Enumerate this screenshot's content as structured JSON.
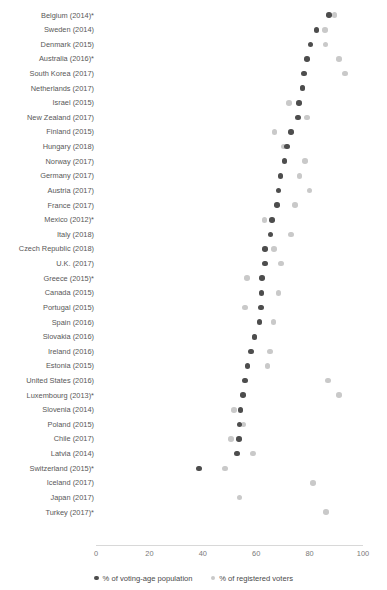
{
  "chart_data": {
    "type": "scatter",
    "subtype": "dot-plot",
    "title": "",
    "xlabel": "",
    "ylabel": "",
    "xlim": [
      0,
      100
    ],
    "xticks": [
      0,
      20,
      40,
      60,
      80,
      100
    ],
    "grid": false,
    "legend_position": "bottom",
    "series": [
      {
        "name": "% of voting-age population",
        "color": "#4d4d4d"
      },
      {
        "name": "% of registered voters",
        "color": "#c9c9c9"
      }
    ],
    "categories": [
      "Belgium (2014)*",
      "Sweden (2014)",
      "Denmark (2015)",
      "Australia (2016)*",
      "South Korea (2017)",
      "Netherlands (2017)",
      "Israel (2015)",
      "New Zealand (2017)",
      "Finland (2015)",
      "Hungary (2018)",
      "Norway (2017)",
      "Germany (2017)",
      "Austria (2017)",
      "France (2017)",
      "Mexico (2012)*",
      "Italy (2018)",
      "Czech Republic (2018)",
      "U.K. (2017)",
      "Greece (2015)*",
      "Canada (2015)",
      "Portugal (2015)",
      "Spain (2016)",
      "Slovakia (2016)",
      "Ireland (2016)",
      "Estonia (2015)",
      "United States (2016)",
      "Luxembourg (2013)*",
      "Slovenia (2014)",
      "Poland (2015)",
      "Chile (2017)",
      "Latvia (2014)",
      "Switzerland (2015)*",
      "Iceland (2017)",
      "Japan (2017)",
      "Turkey (2017)*"
    ],
    "rows": [
      {
        "label": "Belgium (2014)*",
        "voting_age": 87.2,
        "registered": 89.4
      },
      {
        "label": "Sweden (2014)",
        "voting_age": 82.6,
        "registered": 85.8
      },
      {
        "label": "Denmark (2015)",
        "voting_age": 80.3,
        "registered": 85.9
      },
      {
        "label": "Australia (2016)*",
        "voting_age": 79.0,
        "registered": 91.0
      },
      {
        "label": "South Korea (2017)",
        "voting_age": 77.9,
        "registered": 93.2
      },
      {
        "label": "Netherlands (2017)",
        "voting_age": 77.3,
        "registered": 77.3
      },
      {
        "label": "Israel (2015)",
        "voting_age": 76.1,
        "registered": 72.3
      },
      {
        "label": "New Zealand (2017)",
        "voting_age": 75.7,
        "registered": 79.0
      },
      {
        "label": "Finland (2015)",
        "voting_age": 73.1,
        "registered": 66.9
      },
      {
        "label": "Hungary (2018)",
        "voting_age": 71.6,
        "registered": 70.2
      },
      {
        "label": "Norway (2017)",
        "voting_age": 70.6,
        "registered": 78.2
      },
      {
        "label": "Germany (2017)",
        "voting_age": 69.1,
        "registered": 76.2
      },
      {
        "label": "Austria (2017)",
        "voting_age": 68.3,
        "registered": 80.0
      },
      {
        "label": "France (2017)",
        "voting_age": 67.9,
        "registered": 74.6
      },
      {
        "label": "Mexico (2012)*",
        "voting_age": 66.0,
        "registered": 63.1
      },
      {
        "label": "Italy (2018)",
        "voting_age": 65.4,
        "registered": 73.1
      },
      {
        "label": "Czech Republic (2018)",
        "voting_age": 63.4,
        "registered": 66.7
      },
      {
        "label": "U.K. (2017)",
        "voting_age": 63.2,
        "registered": 69.3
      },
      {
        "label": "Greece (2015)*",
        "voting_age": 62.1,
        "registered": 56.6
      },
      {
        "label": "Canada (2015)",
        "voting_age": 62.0,
        "registered": 68.3
      },
      {
        "label": "Portugal (2015)",
        "voting_age": 61.8,
        "registered": 55.8
      },
      {
        "label": "Spain (2016)",
        "voting_age": 61.2,
        "registered": 66.5
      },
      {
        "label": "Slovakia (2016)",
        "voting_age": 59.4,
        "registered": 59.4
      },
      {
        "label": "Ireland (2016)",
        "voting_age": 58.0,
        "registered": 65.1
      },
      {
        "label": "Estonia (2015)",
        "voting_age": 56.8,
        "registered": 64.2
      },
      {
        "label": "United States (2016)",
        "voting_age": 55.7,
        "registered": 86.8
      },
      {
        "label": "Luxembourg (2013)*",
        "voting_age": 55.1,
        "registered": 91.1
      },
      {
        "label": "Slovenia (2014)",
        "voting_age": 54.1,
        "registered": 51.7
      },
      {
        "label": "Poland (2015)",
        "voting_age": 53.8,
        "registered": 55.3
      },
      {
        "label": "Chile (2017)",
        "voting_age": 53.6,
        "registered": 50.5
      },
      {
        "label": "Latvia (2014)",
        "voting_age": 52.8,
        "registered": 58.8
      },
      {
        "label": "Switzerland (2015)*",
        "voting_age": 38.6,
        "registered": 48.4
      },
      {
        "label": "Iceland (2017)",
        "voting_age": null,
        "registered": 81.2
      },
      {
        "label": "Japan (2017)",
        "voting_age": null,
        "registered": 53.7
      },
      {
        "label": "Turkey (2017)*",
        "voting_age": null,
        "registered": 86.2
      }
    ]
  },
  "legend": {
    "items": [
      {
        "label": "% of voting-age population",
        "color": "#4d4d4d"
      },
      {
        "label": "% of registered voters",
        "color": "#c9c9c9"
      }
    ]
  },
  "axis": {
    "ticks": [
      "0",
      "20",
      "40",
      "60",
      "80",
      "100"
    ]
  }
}
